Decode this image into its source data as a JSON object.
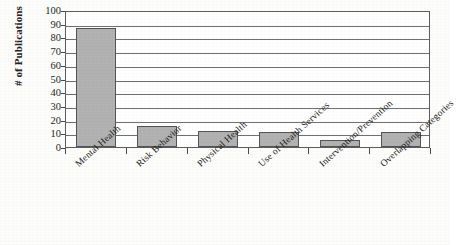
{
  "chart_data": {
    "type": "bar",
    "title": "",
    "subtitle": "",
    "xlabel": "",
    "ylabel": "# of Publications",
    "categories": [
      "Mental Health",
      "Risk Behavior",
      "Physical Health",
      "Use of Health Services",
      "Intervention/Prevention",
      "Overlapping Categories"
    ],
    "values": [
      87,
      15,
      12,
      11,
      5,
      11
    ],
    "ylim": [
      0,
      100
    ],
    "ytick_labels": [
      "100",
      "90",
      "80",
      "70",
      "60",
      "50",
      "40",
      "30",
      "20",
      "10",
      "0"
    ],
    "ytick_values": [
      100,
      90,
      80,
      70,
      60,
      50,
      40,
      30,
      20,
      10,
      0
    ],
    "ytick_step": 10,
    "grid": true,
    "grid_axis": "y",
    "legend": false,
    "legend_position": "none",
    "bar_fill_color": "#b2b2b2",
    "bar_border_color": "#555555",
    "axis_color": "#5d5d5d",
    "gridline_color": "#6f6f6f",
    "plot_background": "#ffffff",
    "figure_background": "#fdfdfc",
    "xtick_label_rotation": -42
  }
}
